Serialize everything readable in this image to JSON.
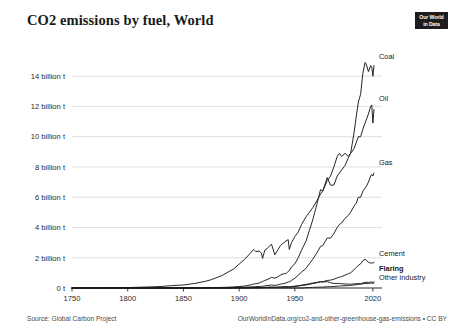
{
  "header": {
    "title": "CO2 emissions by fuel, World",
    "logo_line1": "Our World",
    "logo_line2": "in Data"
  },
  "footer": {
    "source": "Source: Global Carbon Project",
    "attribution": "OurWorldInData.org/co2-and-other-greenhouse-gas-emissions • CC BY"
  },
  "chart_data": {
    "type": "line",
    "title": "CO2 emissions by fuel, World",
    "xlabel": "",
    "ylabel": "",
    "xlim": [
      1750,
      2021
    ],
    "ylim": [
      0,
      15.2
    ],
    "grid": true,
    "legend_position": "right-inline",
    "y_unit": "billion t",
    "yticks": [
      0,
      2,
      4,
      6,
      8,
      10,
      12,
      14
    ],
    "ytick_labels": [
      "0 t",
      "2 billion t",
      "4 billion t",
      "6 billion t",
      "8 billion t",
      "10 billion t",
      "12 billion t",
      "14 billion t"
    ],
    "xticks": [
      1750,
      1800,
      1850,
      1900,
      1950,
      2020
    ],
    "xtick_labels": [
      "1750",
      "1800",
      "1850",
      "1900",
      "1950",
      "2020"
    ],
    "x": [
      1750,
      1760,
      1770,
      1780,
      1790,
      1800,
      1810,
      1820,
      1830,
      1840,
      1850,
      1860,
      1870,
      1875,
      1880,
      1885,
      1890,
      1895,
      1900,
      1905,
      1910,
      1913,
      1915,
      1918,
      1920,
      1921,
      1923,
      1925,
      1929,
      1932,
      1935,
      1937,
      1940,
      1942,
      1944,
      1945,
      1947,
      1950,
      1953,
      1956,
      1960,
      1963,
      1966,
      1970,
      1973,
      1975,
      1979,
      1982,
      1985,
      1988,
      1990,
      1992,
      1995,
      1998,
      2000,
      2003,
      2005,
      2007,
      2009,
      2011,
      2013,
      2014,
      2016,
      2018,
      2019,
      2020,
      2021
    ],
    "series": [
      {
        "name": "Coal",
        "label": "Coal",
        "bold": false,
        "values": [
          0.01,
          0.01,
          0.02,
          0.02,
          0.03,
          0.03,
          0.05,
          0.07,
          0.1,
          0.16,
          0.2,
          0.3,
          0.45,
          0.55,
          0.69,
          0.84,
          1.05,
          1.25,
          1.58,
          1.9,
          2.3,
          2.55,
          2.4,
          2.45,
          2.3,
          1.95,
          2.5,
          2.6,
          2.9,
          2.2,
          2.55,
          2.8,
          3.0,
          3.1,
          3.2,
          2.55,
          3.0,
          3.4,
          3.7,
          4.2,
          4.7,
          5.0,
          5.3,
          5.8,
          6.2,
          6.4,
          7.1,
          7.4,
          8.0,
          8.7,
          8.9,
          8.7,
          8.9,
          8.7,
          8.9,
          10.2,
          11.3,
          12.3,
          12.8,
          14.2,
          14.9,
          14.8,
          14.3,
          14.7,
          14.6,
          14.0,
          14.7
        ]
      },
      {
        "name": "Oil",
        "label": "Oil",
        "bold": false,
        "values": [
          0,
          0,
          0,
          0,
          0,
          0,
          0,
          0,
          0,
          0,
          0,
          0.01,
          0.02,
          0.02,
          0.03,
          0.04,
          0.05,
          0.07,
          0.1,
          0.13,
          0.2,
          0.26,
          0.28,
          0.33,
          0.4,
          0.42,
          0.5,
          0.55,
          0.7,
          0.65,
          0.75,
          0.85,
          0.95,
          0.95,
          1.1,
          1.15,
          1.4,
          1.6,
          2.0,
          2.5,
          3.1,
          3.8,
          4.5,
          5.6,
          6.5,
          6.4,
          7.3,
          6.8,
          6.8,
          7.4,
          7.6,
          7.8,
          8.1,
          8.6,
          8.9,
          9.2,
          9.6,
          10.0,
          10.0,
          10.5,
          10.9,
          11.1,
          11.5,
          12.0,
          12.1,
          10.9,
          11.8
        ]
      },
      {
        "name": "Gas",
        "label": "Gas",
        "bold": false,
        "values": [
          0,
          0,
          0,
          0,
          0,
          0,
          0,
          0,
          0,
          0,
          0,
          0,
          0.01,
          0.01,
          0.01,
          0.02,
          0.02,
          0.03,
          0.04,
          0.05,
          0.07,
          0.08,
          0.09,
          0.1,
          0.11,
          0.11,
          0.14,
          0.16,
          0.2,
          0.17,
          0.21,
          0.25,
          0.3,
          0.33,
          0.4,
          0.4,
          0.5,
          0.65,
          0.85,
          1.05,
          1.3,
          1.6,
          1.9,
          2.35,
          2.75,
          2.8,
          3.3,
          3.3,
          3.6,
          4.0,
          4.2,
          4.3,
          4.6,
          4.8,
          5.0,
          5.4,
          5.6,
          6.0,
          6.0,
          6.4,
          6.6,
          6.7,
          7.0,
          7.4,
          7.5,
          7.4,
          7.6
        ]
      },
      {
        "name": "Cement",
        "label": "Cement",
        "bold": false,
        "values": [
          0,
          0,
          0,
          0,
          0,
          0,
          0,
          0,
          0,
          0,
          0,
          0,
          0.001,
          0.002,
          0.003,
          0.004,
          0.006,
          0.008,
          0.011,
          0.014,
          0.02,
          0.024,
          0.022,
          0.022,
          0.026,
          0.026,
          0.033,
          0.038,
          0.05,
          0.04,
          0.05,
          0.06,
          0.065,
          0.06,
          0.06,
          0.055,
          0.075,
          0.1,
          0.13,
          0.16,
          0.2,
          0.24,
          0.29,
          0.35,
          0.4,
          0.41,
          0.5,
          0.52,
          0.58,
          0.67,
          0.72,
          0.75,
          0.85,
          0.95,
          1.0,
          1.2,
          1.35,
          1.5,
          1.6,
          1.8,
          1.9,
          1.85,
          1.7,
          1.65,
          1.65,
          1.65,
          1.7
        ]
      },
      {
        "name": "Flaring",
        "label": "Flaring",
        "bold": true,
        "values": [
          0,
          0,
          0,
          0,
          0,
          0,
          0,
          0,
          0,
          0,
          0,
          0,
          0,
          0,
          0,
          0,
          0,
          0,
          0,
          0.01,
          0.01,
          0.02,
          0.02,
          0.02,
          0.03,
          0.03,
          0.04,
          0.04,
          0.06,
          0.05,
          0.06,
          0.07,
          0.08,
          0.08,
          0.09,
          0.09,
          0.1,
          0.12,
          0.15,
          0.19,
          0.24,
          0.28,
          0.33,
          0.38,
          0.42,
          0.4,
          0.42,
          0.35,
          0.3,
          0.3,
          0.3,
          0.28,
          0.26,
          0.26,
          0.25,
          0.27,
          0.28,
          0.3,
          0.29,
          0.33,
          0.37,
          0.38,
          0.37,
          0.39,
          0.4,
          0.37,
          0.4
        ]
      },
      {
        "name": "Other industry",
        "label": "Other industry",
        "bold": false,
        "values": [
          0,
          0,
          0,
          0,
          0,
          0,
          0,
          0,
          0,
          0,
          0,
          0,
          0,
          0,
          0,
          0,
          0,
          0,
          0,
          0,
          0,
          0,
          0,
          0,
          0,
          0,
          0,
          0,
          0,
          0,
          0,
          0,
          0,
          0,
          0,
          0,
          0,
          0,
          0,
          0,
          0.02,
          0.03,
          0.04,
          0.05,
          0.06,
          0.06,
          0.08,
          0.09,
          0.1,
          0.12,
          0.13,
          0.14,
          0.15,
          0.16,
          0.17,
          0.2,
          0.22,
          0.24,
          0.25,
          0.28,
          0.3,
          0.3,
          0.3,
          0.32,
          0.32,
          0.3,
          0.33
        ]
      }
    ]
  }
}
